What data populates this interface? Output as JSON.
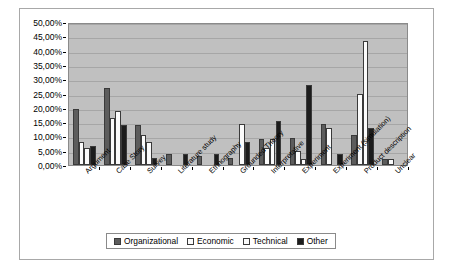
{
  "chart_data": {
    "type": "bar",
    "title": "",
    "xlabel": "",
    "ylabel": "",
    "ylim": [
      0,
      50
    ],
    "grid": true,
    "legend_position": "bottom",
    "categories": [
      "Argument",
      "Case Story",
      "Survey",
      "Literature study",
      "Ethnography",
      "Grounded Theory",
      "Interpretative",
      "Experiment",
      "Experiment (simulation)",
      "Product description",
      "Unclear"
    ],
    "ytick_labels": [
      "0,00%",
      "5,00%",
      "10,00%",
      "15,00%",
      "20,00%",
      "25,00%",
      "30,00%",
      "35,00%",
      "40,00%",
      "45,00%",
      "50,00%"
    ],
    "ytick_values": [
      0,
      5,
      10,
      15,
      20,
      25,
      30,
      35,
      40,
      45,
      50
    ],
    "series": [
      {
        "name": "Organizational",
        "color": "#5c5c5c",
        "values": [
          19.5,
          27.0,
          14.0,
          4.0,
          3.0,
          2.5,
          9.0,
          9.5,
          14.5,
          10.5,
          2.0
        ]
      },
      {
        "name": "Economic",
        "color": "#fbfbfb",
        "values": [
          8.0,
          16.5,
          10.5,
          0.0,
          0.0,
          0.0,
          6.0,
          5.0,
          13.0,
          25.0,
          2.0
        ]
      },
      {
        "name": "Technical",
        "color": "#fbfbfb",
        "values": [
          6.0,
          19.0,
          8.0,
          0.0,
          0.0,
          14.5,
          9.0,
          2.0,
          0.0,
          43.5,
          0.0
        ]
      },
      {
        "name": "Other",
        "color": "#1c1c1c",
        "values": [
          6.5,
          14.0,
          2.5,
          4.0,
          4.0,
          8.0,
          15.5,
          28.0,
          4.0,
          13.0,
          0.0
        ]
      }
    ]
  },
  "legend": {
    "items": [
      {
        "label": "Organizational",
        "color": "#5c5c5c"
      },
      {
        "label": "Economic",
        "color": "#fbfbfb"
      },
      {
        "label": "Technical",
        "color": "#fbfbfb"
      },
      {
        "label": "Other",
        "color": "#1c1c1c"
      }
    ]
  }
}
